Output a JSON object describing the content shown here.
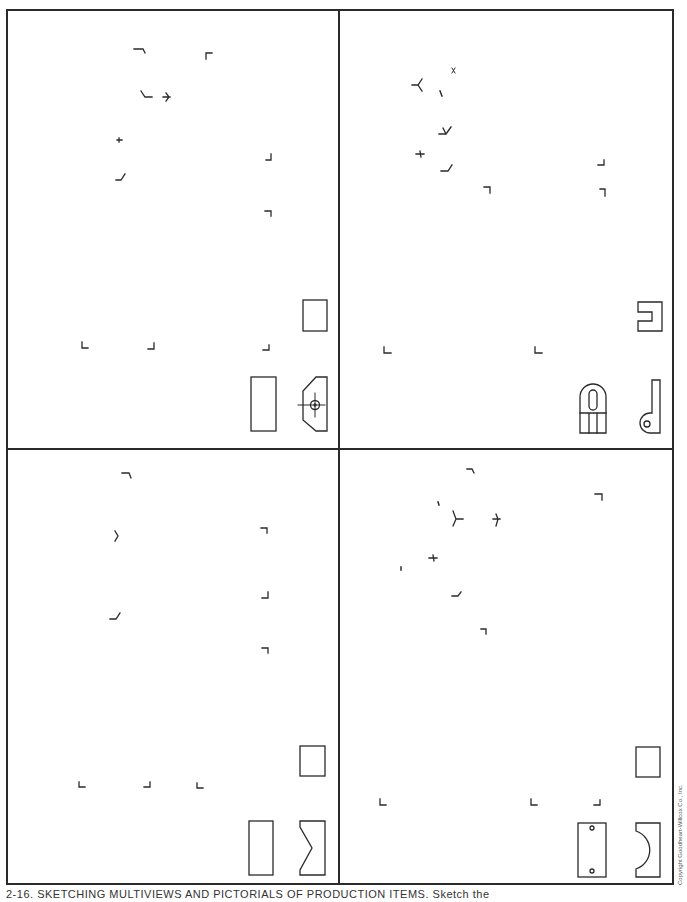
{
  "page": {
    "caption": "2-16. SKETCHING MULTIVIEWS AND PICTORIALS OF PRODUCTION ITEMS. Sketch the",
    "copyright": "Copyright Goodheart-Willcox Co., Inc."
  },
  "quadrants": [
    {
      "id": "top-left",
      "description": "Isometric grid tick marks with three orthographic views: rectangle (top view), tall rectangle (front view), chamfered block with hole and centerlines (side view)"
    },
    {
      "id": "top-right",
      "description": "Isometric grid tick marks with three orthographic views: slotted bracket outline, rounded-top part with slot, L-shaped bracket with hole"
    },
    {
      "id": "bottom-left",
      "description": "Isometric grid tick marks with three orthographic views: rectangle, tall rectangle, V-notched block"
    },
    {
      "id": "bottom-right",
      "description": "Isometric grid tick marks with three orthographic views: rectangle, plate with two holes, block with semicircular cutout"
    }
  ],
  "colors": {
    "ink": "#2a2a2a",
    "paper": "#ffffff"
  }
}
